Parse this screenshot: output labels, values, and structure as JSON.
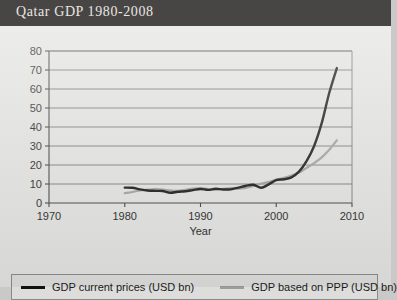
{
  "header": {
    "title": "Qatar GDP 1980-2008"
  },
  "chart_data": {
    "type": "line",
    "title": "Qatar GDP 1980-2008",
    "xlabel": "Year",
    "ylabel": "",
    "xlim": [
      1970,
      2010
    ],
    "ylim": [
      0,
      80
    ],
    "xticks": [
      1970,
      1980,
      1990,
      2000,
      2010
    ],
    "yticks": [
      0,
      10,
      20,
      30,
      40,
      50,
      60,
      70,
      80
    ],
    "grid": "horizontal",
    "legend_position": "bottom",
    "x": [
      1980,
      1981,
      1982,
      1983,
      1984,
      1985,
      1986,
      1987,
      1988,
      1989,
      1990,
      1991,
      1992,
      1993,
      1994,
      1995,
      1996,
      1997,
      1998,
      1999,
      2000,
      2001,
      2002,
      2003,
      2004,
      2005,
      2006,
      2007,
      2008
    ],
    "series": [
      {
        "name": "GDP current prices (USD bn)",
        "color": "#111111",
        "values": [
          8.1,
          8.0,
          7.2,
          6.6,
          6.4,
          6.3,
          5.4,
          5.9,
          6.2,
          6.8,
          7.4,
          6.9,
          7.5,
          7.1,
          7.2,
          8.1,
          9.1,
          9.6,
          8.0,
          9.8,
          12.0,
          12.5,
          13.5,
          16.5,
          22.0,
          30.0,
          42.0,
          58.0,
          71.0
        ]
      },
      {
        "name": "GDP based on PPP (USD bn)",
        "color": "#9d9d9d",
        "values": [
          5.2,
          5.8,
          6.6,
          7.0,
          7.3,
          7.1,
          6.6,
          6.4,
          6.9,
          7.6,
          7.9,
          7.3,
          7.0,
          7.4,
          7.9,
          7.6,
          8.0,
          9.0,
          10.2,
          11.0,
          12.3,
          13.2,
          14.5,
          16.0,
          18.5,
          21.0,
          24.0,
          28.0,
          33.0
        ]
      }
    ]
  },
  "legend": {
    "items": [
      {
        "label": "GDP current prices (USD bn)",
        "color": "#111111"
      },
      {
        "label": "GDP based on PPP (USD bn)",
        "color": "#9d9d9d"
      }
    ]
  }
}
